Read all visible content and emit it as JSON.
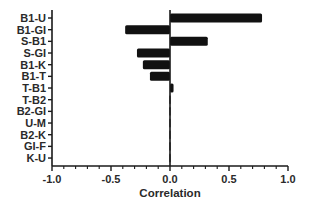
{
  "chart_data": {
    "type": "bar",
    "orientation": "horizontal",
    "title": "",
    "xlabel": "Correlation",
    "ylabel": "",
    "xlim": [
      -1.0,
      1.0
    ],
    "xticks": [
      -1.0,
      -0.5,
      0.0,
      0.5,
      1.0
    ],
    "xtick_labels": [
      "-1.0",
      "-0.5",
      "0.0",
      "0.5",
      "1.0"
    ],
    "minor_ticks_per_major": 4,
    "grid": false,
    "legend": null,
    "bar_color": "#111111",
    "categories": [
      "B1-U",
      "B1-GI",
      "S-B1",
      "S-GI",
      "B1-K",
      "B1-T",
      "T-B1",
      "T-B2",
      "B2-GI",
      "U-M",
      "B2-K",
      "GI-F",
      "K-U"
    ],
    "values": [
      0.78,
      -0.38,
      0.32,
      -0.28,
      -0.23,
      -0.17,
      0.03,
      -0.01,
      -0.01,
      0.01,
      -0.01,
      0.0,
      0.0
    ]
  }
}
